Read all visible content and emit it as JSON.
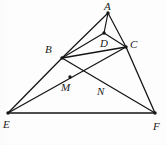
{
  "figure": {
    "type": "geometry-diagram",
    "width": 166,
    "height": 145,
    "background_color": "#fdfdfd",
    "stroke_color": "#151515",
    "label_color": "#1a1a1a"
  },
  "points": [
    {
      "id": "A",
      "label": "A",
      "x": 108,
      "y": 13,
      "label_x": 104,
      "label_y": 1,
      "dot": true
    },
    {
      "id": "B",
      "label": "B",
      "x": 62,
      "y": 58,
      "label_x": 45,
      "label_y": 44,
      "dot": true
    },
    {
      "id": "C",
      "label": "C",
      "x": 126,
      "y": 47,
      "label_x": 130,
      "label_y": 39,
      "dot": true
    },
    {
      "id": "D",
      "label": "D",
      "x": 104,
      "y": 33,
      "label_x": 100,
      "label_y": 38,
      "dot": true
    },
    {
      "id": "E",
      "label": "E",
      "x": 8,
      "y": 113,
      "label_x": 3,
      "label_y": 119,
      "dot": true
    },
    {
      "id": "F",
      "label": "F",
      "x": 155,
      "y": 113,
      "label_x": 153,
      "label_y": 121,
      "dot": true
    },
    {
      "id": "M",
      "label": "M",
      "x": 70,
      "y": 77,
      "label_x": 61,
      "label_y": 82,
      "dot": true
    },
    {
      "id": "N",
      "label": "N",
      "x": 106,
      "y": 83,
      "label_x": 97,
      "label_y": 86,
      "dot": false
    }
  ],
  "segments": [
    {
      "id": "A-B",
      "from": "A",
      "to": "B",
      "width": 1.2
    },
    {
      "id": "A-D",
      "from": "A",
      "to": "D",
      "width": 1.2
    },
    {
      "id": "A-C",
      "from": "A",
      "to": "C",
      "width": 1.2
    },
    {
      "id": "B-D",
      "from": "B",
      "to": "D",
      "width": 1.2
    },
    {
      "id": "D-C",
      "from": "D",
      "to": "C",
      "width": 1.2
    },
    {
      "id": "B-C",
      "from": "B",
      "to": "C",
      "width": 1.4
    },
    {
      "id": "B-E",
      "from": "B",
      "to": "E",
      "width": 1.3
    },
    {
      "id": "B-F",
      "from": "B",
      "to": "F",
      "width": 1.3
    },
    {
      "id": "C-E",
      "from": "C",
      "to": "E",
      "width": 1.3
    },
    {
      "id": "C-F",
      "from": "C",
      "to": "F",
      "width": 1.3
    },
    {
      "id": "E-F",
      "from": "E",
      "to": "F",
      "width": 1.3
    }
  ]
}
